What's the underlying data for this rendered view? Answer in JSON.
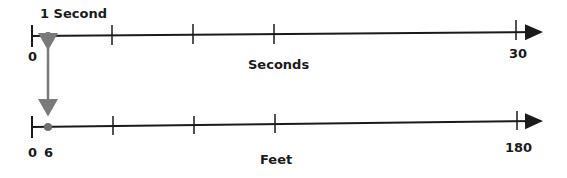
{
  "diagram": {
    "type": "double number line",
    "top_line": {
      "axis_label": "Seconds",
      "tick_labels": [
        "0",
        "30"
      ],
      "point_label": "1 Second",
      "point_value": 1,
      "start": 0,
      "end": 30
    },
    "bottom_line": {
      "axis_label": "Feet",
      "tick_labels": [
        "0",
        "6",
        "180"
      ],
      "point_value": 6,
      "start": 0,
      "end": 180
    },
    "connector": "double-headed arrow linking 1 second to 6 feet",
    "colors": {
      "line": "#1a1a1a",
      "point": "#6f6f6f",
      "connector": "#7a7a7a"
    }
  }
}
